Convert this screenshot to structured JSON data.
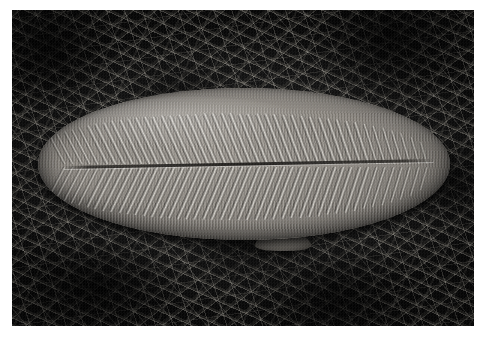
{
  "figure": {
    "kind": "photograph",
    "medium": "black-and-white photographic print",
    "caption": "",
    "border": {
      "color": "#ffffff",
      "description": "white print margin surrounding the photograph"
    },
    "photo": {
      "label": "fossil specimen photograph",
      "tone": "grayscale",
      "bounds_px": {
        "x": 12,
        "y": 10,
        "width": 462,
        "height": 316
      }
    }
  },
  "background": {
    "name": "straw-litter-background",
    "description": "dense bed of dry straw, grass stems and pine needles lying in many crossing directions",
    "colors": {
      "darkest": "#070707",
      "dark": "#141414",
      "mid": "#2b2b2b",
      "highlight": "#cdc8bc",
      "bright_highlight": "#f0ece2"
    }
  },
  "specimen": {
    "name": "dickinsonia-fossil",
    "common_description": "large ovoid segmented Ediacaran fossil (Dickinsonia-like)",
    "shape": "elongate oval / ellipse, tapering slightly to the left end",
    "bounds_px": {
      "x": 38,
      "y": 88,
      "width": 412,
      "height": 152
    },
    "colors": {
      "highlight": "#a7a29a",
      "body": "#8e8982",
      "shadow": "#6e6a64",
      "groove": "#2a2825"
    },
    "features": {
      "midline": {
        "name": "central-midline-groove",
        "description": "dark longitudinal groove running the full length, dividing the body into two halves"
      },
      "ribs": {
        "name": "body-segments",
        "description": "closely packed transverse ribs (isomers) angled away from the midline on both sides",
        "upper_count": 44,
        "lower_count": 44,
        "upper_angle_deg": -22,
        "lower_angle_deg": 22
      },
      "bump": {
        "name": "lower-margin-bump",
        "description": "small raised knob on the lower margin just left of centre"
      }
    }
  }
}
